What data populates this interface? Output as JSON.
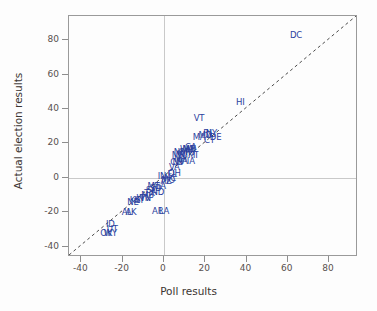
{
  "chart_data": {
    "type": "scatter",
    "title": "",
    "xlabel": "Poll results",
    "ylabel": "Actual election results",
    "xlim": [
      -46,
      94
    ],
    "ylim": [
      -46,
      94
    ],
    "xticks": [
      -40,
      -20,
      0,
      20,
      40,
      60,
      80
    ],
    "yticks": [
      -40,
      -20,
      0,
      20,
      40,
      60,
      80
    ],
    "xticklabels": [
      "-40",
      "-20",
      "0",
      "20",
      "40",
      "60",
      "80"
    ],
    "yticklabels": [
      "-40",
      "-20",
      "0",
      "20",
      "40",
      "60",
      "80"
    ],
    "grid": "zero-lines-only",
    "legend": "none",
    "marker_style": "text-labels",
    "marker_color": "#2b3f9e",
    "reference_line": {
      "type": "dashed-identity",
      "label": "y = x",
      "color": "#4a4a4a",
      "from": [
        -46,
        -46
      ],
      "to": [
        94,
        94
      ]
    },
    "point_label_field": "state",
    "points": [
      {
        "state": "DC",
        "x": 64,
        "y": 83
      },
      {
        "state": "HI",
        "x": 37,
        "y": 44
      },
      {
        "state": "VT",
        "x": 17,
        "y": 35
      },
      {
        "state": "MA",
        "x": 17,
        "y": 24
      },
      {
        "state": "RI",
        "x": 21,
        "y": 26
      },
      {
        "state": "NY",
        "x": 23,
        "y": 26
      },
      {
        "state": "DE",
        "x": 25,
        "y": 24
      },
      {
        "state": "CT",
        "x": 22,
        "y": 22
      },
      {
        "state": "MD",
        "x": 20,
        "y": 25
      },
      {
        "state": "IL",
        "x": 15,
        "y": 17
      },
      {
        "state": "CA",
        "x": 13,
        "y": 18
      },
      {
        "state": "NJ",
        "x": 13,
        "y": 16
      },
      {
        "state": "WA",
        "x": 11,
        "y": 17
      },
      {
        "state": "ME",
        "x": 12,
        "y": 17
      },
      {
        "state": "MI",
        "x": 14,
        "y": 13
      },
      {
        "state": "OR",
        "x": 10,
        "y": 15
      },
      {
        "state": "WI",
        "x": 9,
        "y": 14
      },
      {
        "state": "NM",
        "x": 8,
        "y": 15
      },
      {
        "state": "MN",
        "x": 7,
        "y": 13
      },
      {
        "state": "NH",
        "x": 8,
        "y": 11
      },
      {
        "state": "PA",
        "x": 9,
        "y": 10
      },
      {
        "state": "NV",
        "x": 7,
        "y": 9
      },
      {
        "state": "IA",
        "x": 13,
        "y": 10
      },
      {
        "state": "CO",
        "x": 6,
        "y": 9
      },
      {
        "state": "VA",
        "x": 5,
        "y": 6
      },
      {
        "state": "OH",
        "x": 5,
        "y": 3
      },
      {
        "state": "FL",
        "x": 4,
        "y": 2
      },
      {
        "state": "NC",
        "x": 3,
        "y": 0
      },
      {
        "state": "IN",
        "x": -1,
        "y": 1
      },
      {
        "state": "MO",
        "x": 2,
        "y": -1
      },
      {
        "state": "AZ",
        "x": 1,
        "y": -2
      },
      {
        "state": "GA",
        "x": -2,
        "y": -5
      },
      {
        "state": "SD",
        "x": -4,
        "y": -6
      },
      {
        "state": "MT",
        "x": -5,
        "y": -5
      },
      {
        "state": "ND",
        "x": -3,
        "y": -8
      },
      {
        "state": "SC",
        "x": -6,
        "y": -7
      },
      {
        "state": "TX",
        "x": -7,
        "y": -9
      },
      {
        "state": "MS",
        "x": -8,
        "y": -10
      },
      {
        "state": "TN",
        "x": -9,
        "y": -12
      },
      {
        "state": "WV",
        "x": -10,
        "y": -12
      },
      {
        "state": "KY",
        "x": -12,
        "y": -13
      },
      {
        "state": "KS",
        "x": -14,
        "y": -13
      },
      {
        "state": "NE",
        "x": -15,
        "y": -14
      },
      {
        "state": "AR",
        "x": -3,
        "y": -19
      },
      {
        "state": "LA",
        "x": 0,
        "y": -19
      },
      {
        "state": "AL",
        "x": -18,
        "y": -20
      },
      {
        "state": "AK",
        "x": -16,
        "y": -20
      },
      {
        "state": "ID",
        "x": -26,
        "y": -27
      },
      {
        "state": "UT",
        "x": -25,
        "y": -30
      },
      {
        "state": "OK",
        "x": -28,
        "y": -32
      },
      {
        "state": "WY",
        "x": -26,
        "y": -32
      }
    ]
  }
}
